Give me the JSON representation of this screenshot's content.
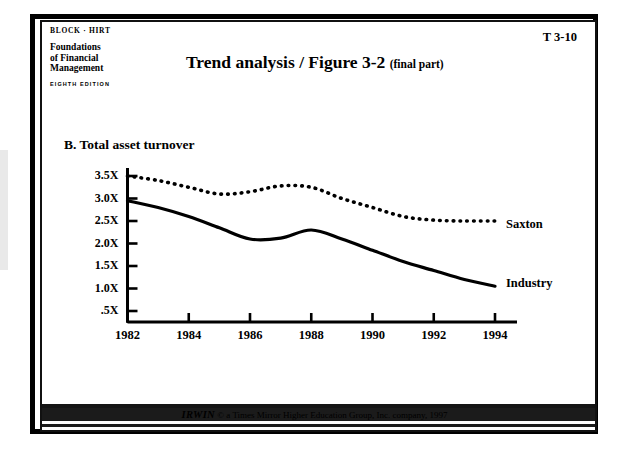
{
  "publisher": {
    "authors": "BLOCK · HIRT",
    "book_title_line1": "Foundations",
    "book_title_line2": "of  Financial",
    "book_title_line3": "Management",
    "edition": "EIGHTH EDITION"
  },
  "slide": {
    "number": "T 3-10",
    "title_main": "Trend analysis / Figure 3-2",
    "title_sub": "(final part)",
    "section_heading": "B.  Total asset turnover"
  },
  "footer": {
    "brand": "IRWIN",
    "copyright": "© a  Times Mirror Higher Education Group, Inc. company, 1997"
  },
  "chart_data": {
    "type": "line",
    "title": "B.  Total asset turnover",
    "xlabel": "",
    "ylabel": "",
    "grid": false,
    "legend_position": "right-inline",
    "xlim": [
      1982,
      1994
    ],
    "ylim": [
      0,
      3.75
    ],
    "x_ticks": [
      1982,
      1984,
      1986,
      1988,
      1990,
      1992,
      1994
    ],
    "x_tick_labels": [
      "1982",
      "1984",
      "1986",
      "1988",
      "1990",
      "1992",
      "1994"
    ],
    "y_ticks": [
      0.5,
      1.0,
      1.5,
      2.0,
      2.5,
      3.0,
      3.5
    ],
    "y_tick_labels": [
      ".5X",
      "1.0X",
      "1.5X",
      "2.0X",
      "2.5X",
      "3.0X",
      "3.5X"
    ],
    "x": [
      1982,
      1983,
      1984,
      1985,
      1986,
      1987,
      1988,
      1989,
      1990,
      1991,
      1992,
      1993,
      1994
    ],
    "series": [
      {
        "name": "Saxton",
        "style": "dashed",
        "color": "#000000",
        "values": [
          3.5,
          3.4,
          3.25,
          3.1,
          3.15,
          3.28,
          3.25,
          3.0,
          2.8,
          2.6,
          2.52,
          2.5,
          2.5
        ]
      },
      {
        "name": "Industry",
        "style": "solid",
        "color": "#000000",
        "values": [
          2.95,
          2.8,
          2.6,
          2.35,
          2.1,
          2.12,
          2.3,
          2.1,
          1.85,
          1.6,
          1.4,
          1.2,
          1.05
        ]
      }
    ]
  }
}
